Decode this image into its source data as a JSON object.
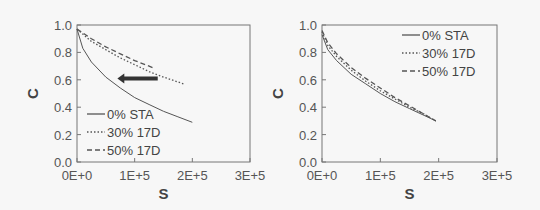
{
  "chart_data": [
    {
      "type": "line",
      "panel": "left",
      "xlabel": "S",
      "ylabel": "C",
      "xlim": [
        0,
        300000
      ],
      "ylim": [
        0,
        1.0
      ],
      "xticks": [
        "0E+0",
        "1E+5",
        "2E+5",
        "3E+5"
      ],
      "yticks": [
        "0.0",
        "0.2",
        "0.4",
        "0.6",
        "0.8",
        "1.0"
      ],
      "legend_position": "lower left",
      "annotation": "left-pointing arrow at C≈0.6, from S≈1.4E+5 to S≈0.7E+5",
      "series": [
        {
          "name": "0% STA",
          "style": "solid",
          "x": [
            0,
            10000,
            25000,
            50000,
            75000,
            100000,
            125000,
            150000,
            175000,
            200000
          ],
          "y": [
            0.97,
            0.83,
            0.73,
            0.62,
            0.54,
            0.47,
            0.42,
            0.37,
            0.33,
            0.29
          ]
        },
        {
          "name": "30% 17D",
          "style": "dotted",
          "x": [
            0,
            25000,
            50000,
            75000,
            100000,
            125000,
            150000,
            185000
          ],
          "y": [
            0.97,
            0.88,
            0.82,
            0.76,
            0.71,
            0.66,
            0.62,
            0.57
          ]
        },
        {
          "name": "50% 17D",
          "style": "dashed",
          "x": [
            0,
            25000,
            50000,
            75000,
            100000,
            125000,
            135000
          ],
          "y": [
            0.97,
            0.9,
            0.84,
            0.79,
            0.74,
            0.7,
            0.68
          ]
        }
      ]
    },
    {
      "type": "line",
      "panel": "right",
      "xlabel": "S",
      "ylabel": "C",
      "xlim": [
        0,
        300000
      ],
      "ylim": [
        0,
        1.0
      ],
      "xticks": [
        "0E+0",
        "1E+5",
        "2E+5",
        "3E+5"
      ],
      "yticks": [
        "0.0",
        "0.2",
        "0.4",
        "0.6",
        "0.8",
        "1.0"
      ],
      "legend_position": "upper right",
      "series": [
        {
          "name": "0% STA",
          "style": "solid",
          "x": [
            0,
            10000,
            25000,
            50000,
            75000,
            100000,
            125000,
            150000,
            175000,
            195000
          ],
          "y": [
            0.93,
            0.82,
            0.74,
            0.64,
            0.57,
            0.5,
            0.44,
            0.39,
            0.34,
            0.3
          ]
        },
        {
          "name": "30% 17D",
          "style": "dotted",
          "x": [
            0,
            10000,
            25000,
            50000,
            75000,
            100000,
            125000,
            150000,
            175000,
            195000
          ],
          "y": [
            0.95,
            0.85,
            0.77,
            0.67,
            0.59,
            0.52,
            0.46,
            0.4,
            0.35,
            0.3
          ]
        },
        {
          "name": "50% 17D",
          "style": "dashed",
          "x": [
            0,
            10000,
            25000,
            50000,
            75000,
            100000,
            125000,
            150000,
            175000,
            195000
          ],
          "y": [
            0.96,
            0.87,
            0.79,
            0.69,
            0.61,
            0.54,
            0.47,
            0.41,
            0.35,
            0.3
          ]
        }
      ]
    }
  ]
}
